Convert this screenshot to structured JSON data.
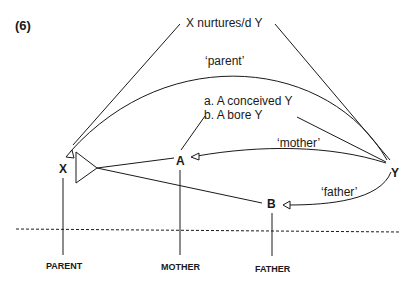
{
  "figure_number": "(6)",
  "top_predicate": "X nurtures/d Y",
  "arc_labels": {
    "parent": "‘parent’",
    "mother": "‘mother’",
    "father": "‘father’"
  },
  "conditions": {
    "a": "a.  A conceived Y",
    "b": "b.  A bore Y"
  },
  "nodes": {
    "x": "X",
    "a": "A",
    "b": "B",
    "y": "Y"
  },
  "captions": {
    "parent": "PARENT",
    "mother": "MOTHER",
    "father": "FATHER"
  },
  "colors": {
    "ink": "#1a1a1a",
    "background": "#ffffff"
  }
}
